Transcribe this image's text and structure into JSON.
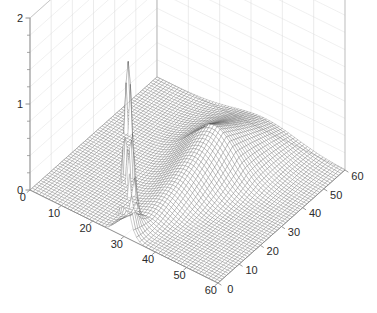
{
  "figure": {
    "kind": "matlab-3d-surface-plot",
    "background_color": "#ffffff",
    "mesh_color": "#5a5a5a",
    "grid_color": "#d8d8d8",
    "axis_color": "#909090",
    "text_color": "#2b2b2b"
  },
  "chart_data": {
    "type": "surface",
    "title": "",
    "xlabel": "",
    "ylabel": "",
    "zlabel": "",
    "grid": true,
    "legend": null,
    "projection": "3d-mesh",
    "view": {
      "azimuth": -37.5,
      "elevation": 30
    },
    "axes": {
      "x": {
        "label": "",
        "min": 0,
        "max": 60,
        "ticks": [
          0,
          10,
          20,
          30,
          40,
          50,
          60
        ],
        "tick_labels": [
          "0",
          "10",
          "20",
          "30",
          "40",
          "50",
          "60"
        ]
      },
      "y": {
        "label": "",
        "min": 0,
        "max": 60,
        "ticks": [
          0,
          10,
          20,
          30,
          40,
          50,
          60
        ],
        "tick_labels": [
          "0",
          "10",
          "20",
          "30",
          "40",
          "50",
          "60"
        ]
      },
      "z": {
        "label": "",
        "min": 0,
        "max": 2,
        "ticks": [
          0,
          1,
          2
        ],
        "tick_labels": [
          "0",
          "1",
          "2"
        ],
        "minor_ticks": [
          0.2,
          0.4,
          0.6,
          0.8,
          1.2,
          1.4,
          1.6,
          1.8
        ]
      }
    },
    "features": [
      {
        "name": "narrow-spike",
        "description": "tall narrow impulse peak",
        "x": 30,
        "y": 2,
        "peak_z": 1.75,
        "x_width": 1.2,
        "y_width": 2.5
      },
      {
        "name": "broad-ridge",
        "description": "broad smooth decaying ridge running along increasing y",
        "x": 30,
        "y_start": 5,
        "y_end": 60,
        "peak_z": 0.52,
        "x_width": 7
      }
    ],
    "surface_grid": {
      "nx": 61,
      "ny": 61,
      "step": 1
    },
    "zlim": [
      0,
      2
    ],
    "xlim": [
      0,
      60
    ],
    "ylim": [
      0,
      60
    ]
  },
  "z_tick_labels": [
    "2",
    "1",
    "0"
  ],
  "x_tick_labels": [
    "0",
    "10",
    "20",
    "30",
    "40",
    "50",
    "60"
  ],
  "y_tick_labels": [
    "0",
    "10",
    "20",
    "30",
    "40",
    "50",
    "60"
  ]
}
